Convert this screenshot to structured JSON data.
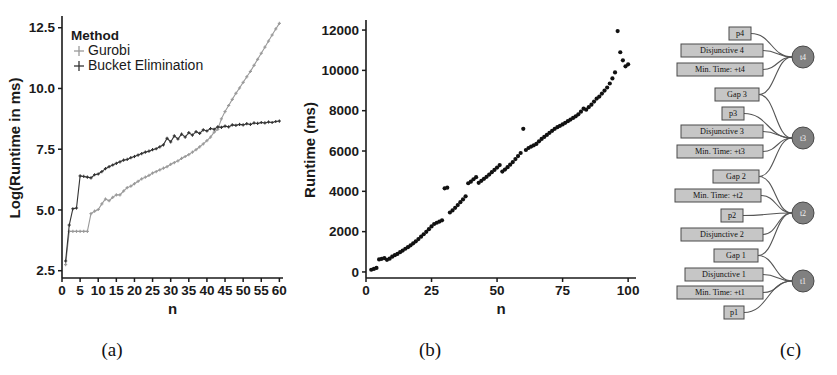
{
  "figure": {
    "panels": [
      {
        "id": "a",
        "caption": "(a)"
      },
      {
        "id": "b",
        "caption": "(b)"
      },
      {
        "id": "c",
        "caption": "(c)"
      }
    ]
  },
  "chart_data": [
    {
      "type": "line",
      "panel": "(a)",
      "title": "",
      "xlabel": "n",
      "ylabel": "Log(Runtime in ms)",
      "xlim": [
        0,
        61
      ],
      "ylim": [
        2.2,
        12.9
      ],
      "xticks": [
        0,
        5,
        10,
        15,
        20,
        25,
        30,
        35,
        40,
        45,
        50,
        55,
        60
      ],
      "yticks": [
        2.5,
        5.0,
        7.5,
        10.0,
        12.5
      ],
      "grid": false,
      "legend": {
        "title": "Method",
        "position": "top-left",
        "entries": [
          "Gurobi",
          "Bucket Elimination"
        ]
      },
      "colors": {
        "gurobi": "#9a9a9a",
        "bucket_elimination": "#333333"
      },
      "x": [
        1,
        2,
        3,
        4,
        5,
        6,
        7,
        8,
        9,
        10,
        11,
        12,
        13,
        14,
        15,
        16,
        17,
        18,
        19,
        20,
        21,
        22,
        23,
        24,
        25,
        26,
        27,
        28,
        29,
        30,
        31,
        32,
        33,
        34,
        35,
        36,
        37,
        38,
        39,
        40,
        41,
        42,
        43,
        44,
        45,
        46,
        47,
        48,
        49,
        50,
        51,
        52,
        53,
        54,
        55,
        56,
        57,
        58,
        59,
        60
      ],
      "series": [
        {
          "name": "Gurobi",
          "values": [
            2.75,
            4.12,
            4.12,
            4.12,
            4.12,
            4.12,
            4.12,
            4.85,
            4.95,
            5.02,
            5.25,
            5.45,
            5.38,
            5.52,
            5.62,
            5.62,
            5.78,
            5.92,
            5.98,
            6.08,
            6.18,
            6.28,
            6.35,
            6.42,
            6.52,
            6.58,
            6.65,
            6.72,
            6.78,
            6.88,
            6.95,
            7.02,
            7.12,
            7.2,
            7.28,
            7.38,
            7.48,
            7.6,
            7.72,
            7.85,
            8.0,
            8.2,
            8.32,
            8.75,
            9.05,
            9.3,
            9.55,
            9.8,
            10.02,
            10.25,
            10.48,
            10.7,
            10.95,
            11.2,
            11.45,
            11.7,
            11.95,
            12.2,
            12.45,
            12.68
          ]
        },
        {
          "name": "Bucket Elimination",
          "values": [
            2.9,
            4.38,
            5.05,
            5.08,
            6.4,
            6.38,
            6.35,
            6.32,
            6.45,
            6.48,
            6.58,
            6.7,
            6.78,
            6.85,
            6.92,
            6.98,
            7.05,
            7.08,
            7.15,
            7.2,
            7.26,
            7.32,
            7.38,
            7.42,
            7.48,
            7.52,
            7.6,
            7.68,
            7.95,
            7.8,
            8.05,
            7.92,
            8.12,
            8.0,
            8.18,
            8.08,
            8.22,
            8.15,
            8.3,
            8.25,
            8.35,
            8.32,
            8.42,
            8.4,
            8.45,
            8.42,
            8.5,
            8.48,
            8.52,
            8.5,
            8.55,
            8.52,
            8.58,
            8.56,
            8.6,
            8.58,
            8.62,
            8.6,
            8.64,
            8.66
          ]
        }
      ]
    },
    {
      "type": "scatter",
      "panel": "(b)",
      "title": "",
      "xlabel": "n",
      "ylabel": "Runtime (ms)",
      "xlim": [
        0,
        103
      ],
      "ylim": [
        -300,
        12400
      ],
      "xticks": [
        0,
        25,
        50,
        75,
        100
      ],
      "yticks": [
        0,
        2000,
        4000,
        6000,
        8000,
        10000,
        12000
      ],
      "grid": false,
      "color": "#111111",
      "points": [
        [
          2,
          110
        ],
        [
          3,
          150
        ],
        [
          4,
          200
        ],
        [
          5,
          620
        ],
        [
          6,
          650
        ],
        [
          7,
          690
        ],
        [
          8,
          600
        ],
        [
          9,
          660
        ],
        [
          10,
          760
        ],
        [
          11,
          830
        ],
        [
          12,
          900
        ],
        [
          13,
          980
        ],
        [
          14,
          1060
        ],
        [
          15,
          1150
        ],
        [
          16,
          1230
        ],
        [
          17,
          1320
        ],
        [
          18,
          1420
        ],
        [
          19,
          1520
        ],
        [
          20,
          1630
        ],
        [
          21,
          1750
        ],
        [
          22,
          1870
        ],
        [
          23,
          1990
        ],
        [
          24,
          2120
        ],
        [
          25,
          2260
        ],
        [
          26,
          2380
        ],
        [
          27,
          2440
        ],
        [
          28,
          2500
        ],
        [
          29,
          2560
        ],
        [
          30,
          4150
        ],
        [
          31,
          4180
        ],
        [
          32,
          2950
        ],
        [
          33,
          3050
        ],
        [
          34,
          3180
        ],
        [
          35,
          3320
        ],
        [
          36,
          3460
        ],
        [
          37,
          3600
        ],
        [
          38,
          3750
        ],
        [
          39,
          4400
        ],
        [
          40,
          4480
        ],
        [
          41,
          4600
        ],
        [
          42,
          4700
        ],
        [
          43,
          4420
        ],
        [
          44,
          4520
        ],
        [
          45,
          4620
        ],
        [
          46,
          4720
        ],
        [
          47,
          4830
        ],
        [
          48,
          4950
        ],
        [
          49,
          5060
        ],
        [
          50,
          5180
        ],
        [
          51,
          5300
        ],
        [
          52,
          4980
        ],
        [
          53,
          5080
        ],
        [
          54,
          5200
        ],
        [
          55,
          5320
        ],
        [
          56,
          5450
        ],
        [
          57,
          5600
        ],
        [
          58,
          5750
        ],
        [
          59,
          5900
        ],
        [
          60,
          7100
        ],
        [
          61,
          6050
        ],
        [
          62,
          6150
        ],
        [
          63,
          6220
        ],
        [
          64,
          6280
        ],
        [
          65,
          6350
        ],
        [
          66,
          6480
        ],
        [
          67,
          6600
        ],
        [
          68,
          6700
        ],
        [
          69,
          6800
        ],
        [
          70,
          6900
        ],
        [
          71,
          7000
        ],
        [
          72,
          7100
        ],
        [
          73,
          7180
        ],
        [
          74,
          7250
        ],
        [
          75,
          7320
        ],
        [
          76,
          7400
        ],
        [
          77,
          7480
        ],
        [
          78,
          7560
        ],
        [
          79,
          7640
        ],
        [
          80,
          7720
        ],
        [
          81,
          7820
        ],
        [
          82,
          7950
        ],
        [
          83,
          8100
        ],
        [
          84,
          8050
        ],
        [
          85,
          8180
        ],
        [
          86,
          8300
        ],
        [
          87,
          8450
        ],
        [
          88,
          8600
        ],
        [
          89,
          8700
        ],
        [
          90,
          8850
        ],
        [
          91,
          9000
        ],
        [
          92,
          9150
        ],
        [
          93,
          9350
        ],
        [
          94,
          9600
        ],
        [
          95,
          9900
        ],
        [
          96,
          11950
        ],
        [
          97,
          10900
        ],
        [
          98,
          10500
        ],
        [
          99,
          10200
        ],
        [
          100,
          10300
        ]
      ]
    }
  ],
  "diagram": {
    "type": "factor-graph",
    "variable_nodes": [
      {
        "id": "t4",
        "label": "t4"
      },
      {
        "id": "t3",
        "label": "t3"
      },
      {
        "id": "t2",
        "label": "t2"
      },
      {
        "id": "t1",
        "label": "t1"
      }
    ],
    "factor_nodes": [
      {
        "id": "p4",
        "label": "p4"
      },
      {
        "id": "disj4",
        "label": "Disjunctive 4"
      },
      {
        "id": "mint4",
        "label": "Min. Time: +t4"
      },
      {
        "id": "gap3",
        "label": "Gap 3"
      },
      {
        "id": "p3",
        "label": "p3"
      },
      {
        "id": "disj3",
        "label": "Disjunctive 3"
      },
      {
        "id": "mint3",
        "label": "Min. Time: +t3"
      },
      {
        "id": "gap2",
        "label": "Gap 2"
      },
      {
        "id": "mint2",
        "label": "Min. Time: +t2"
      },
      {
        "id": "p2",
        "label": "p2"
      },
      {
        "id": "disj2",
        "label": "Disjunctive 2"
      },
      {
        "id": "gap1",
        "label": "Gap 1"
      },
      {
        "id": "disj1",
        "label": "Disjunctive 1"
      },
      {
        "id": "mint1",
        "label": "Min. Time: +t1"
      },
      {
        "id": "p1",
        "label": "p1"
      }
    ],
    "colors": {
      "node_fill": "#808080",
      "box_fill": "#c6c6c6",
      "edge": "#555555"
    }
  }
}
